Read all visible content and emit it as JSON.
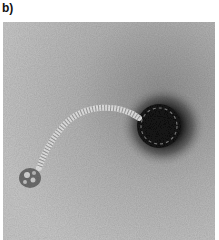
{
  "figure": {
    "panel_label": "b)",
    "image": {
      "subject": "electron micrograph of a tailed bacteriophage",
      "features": [
        "icosahedral-head",
        "flexible-striated-tail",
        "baseplate"
      ],
      "colors": {
        "background": "#b9b9b9",
        "head_stain": "#1a1a1a",
        "tail": "#e2e2e2",
        "baseplate": "#6a6a6a"
      }
    }
  }
}
